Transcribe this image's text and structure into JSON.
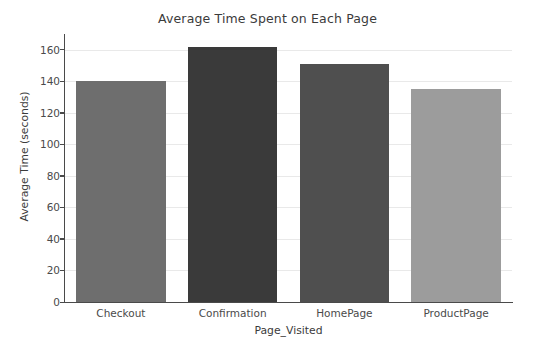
{
  "chart_data": {
    "type": "bar",
    "title": "Average Time Spent on Each Page",
    "xlabel": "Page_Visited",
    "ylabel": "Average Time (seconds)",
    "categories": [
      "Checkout",
      "Confirmation",
      "HomePage",
      "ProductPage"
    ],
    "values": [
      140,
      162,
      151,
      135
    ],
    "bar_colors": [
      "#6e6e6e",
      "#3a3a3a",
      "#4f4f4f",
      "#9c9c9c"
    ],
    "ylim": [
      0,
      170
    ],
    "yticks": [
      0,
      20,
      40,
      60,
      80,
      100,
      120,
      140,
      160
    ],
    "ytick_labels": [
      "0",
      "20",
      "40",
      "60",
      "80",
      "100",
      "120",
      "140",
      "160"
    ],
    "grid": true,
    "grid_axis": "y",
    "grid_color": "#e9e9e9",
    "legend": null,
    "legend_position": "none",
    "background_color": "#ffffff",
    "axis_color": "#4a4a4a",
    "text_color": "#3b3b3b"
  }
}
